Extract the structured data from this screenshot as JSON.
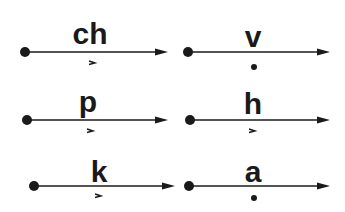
{
  "diagram": {
    "colors": {
      "ink": "#1a1a1a",
      "background": "#ffffff"
    },
    "items": [
      {
        "id": "ch",
        "label": "ch",
        "mark": "tick",
        "line_y": 52,
        "x1": 25,
        "x2": 168,
        "label_x": 90,
        "label_y": 44,
        "mark_x": 92,
        "mark_y": 63
      },
      {
        "id": "v",
        "label": "v",
        "mark": "dot",
        "line_y": 52,
        "x1": 188,
        "x2": 330,
        "label_x": 253,
        "label_y": 47,
        "mark_x": 254,
        "mark_y": 67
      },
      {
        "id": "p",
        "label": "p",
        "mark": "tick",
        "line_y": 120,
        "x1": 27,
        "x2": 168,
        "label_x": 88,
        "label_y": 112,
        "mark_x": 90,
        "mark_y": 131
      },
      {
        "id": "h",
        "label": "h",
        "mark": "tick",
        "line_y": 120,
        "x1": 190,
        "x2": 330,
        "label_x": 253,
        "label_y": 114,
        "mark_x": 252,
        "mark_y": 131
      },
      {
        "id": "k",
        "label": "k",
        "mark": "tick",
        "line_y": 186,
        "x1": 34,
        "x2": 175,
        "label_x": 99,
        "label_y": 182,
        "mark_x": 98,
        "mark_y": 196
      },
      {
        "id": "a",
        "label": "a",
        "mark": "dot",
        "line_y": 186,
        "x1": 189,
        "x2": 330,
        "label_x": 253,
        "label_y": 182,
        "mark_x": 254,
        "mark_y": 198
      }
    ]
  }
}
